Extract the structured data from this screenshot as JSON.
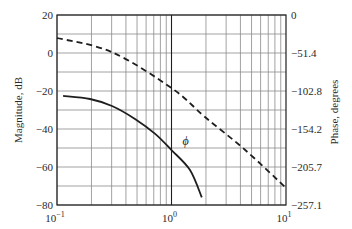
{
  "chart_data": {
    "type": "line",
    "title": "",
    "xlabel": "",
    "xscale": "log",
    "xlim": [
      0.1,
      10
    ],
    "x_ticks": [
      {
        "base": "10",
        "exp": "-1",
        "value": 0.1
      },
      {
        "base": "10",
        "exp": "0",
        "value": 1
      },
      {
        "base": "10",
        "exp": "1",
        "value": 10
      }
    ],
    "ylabel_left": "Magnitude, dB",
    "ylim_left": [
      -80,
      20
    ],
    "y_ticks_left": [
      "20",
      "0",
      "−20",
      "−40",
      "−60",
      "−80"
    ],
    "y_tick_values_left": [
      20,
      0,
      -20,
      -40,
      -60,
      -80
    ],
    "ylabel_right": "Phase, degrees",
    "ylim_right": [
      -257.1,
      0
    ],
    "y_ticks_right": [
      "0",
      "−51.4",
      "−102.8",
      "−154.2",
      "−205.7",
      "−257.1"
    ],
    "y_tick_values_right": [
      0,
      -51.4,
      -102.8,
      -154.2,
      -205.7,
      -257.1
    ],
    "grid": {
      "horizontal_step_db": 10,
      "vertical": "log-decade-minor"
    },
    "legend": null,
    "annotations": [
      {
        "text": "ϕ",
        "x": 1.15,
        "y_db": -44,
        "near_series": "solid"
      }
    ],
    "series": [
      {
        "name": "Magnitude (solid)",
        "style": "solid",
        "axis": "left",
        "x": [
          0.113,
          0.194,
          0.302,
          0.48,
          0.72,
          1.0,
          1.45,
          1.84
        ],
        "values": [
          -22.6,
          -24.2,
          -27.9,
          -34.7,
          -42.6,
          -51.1,
          -61.6,
          -76.0
        ]
      },
      {
        "name": "Phase (dashed)",
        "style": "dashed",
        "axis": "right",
        "x": [
          0.1,
          0.3,
          1.0,
          1.96,
          4.4,
          10
        ],
        "values": [
          -31.1,
          -50.0,
          -98.8,
          -138.0,
          -182.7,
          -234.0
        ]
      }
    ]
  }
}
